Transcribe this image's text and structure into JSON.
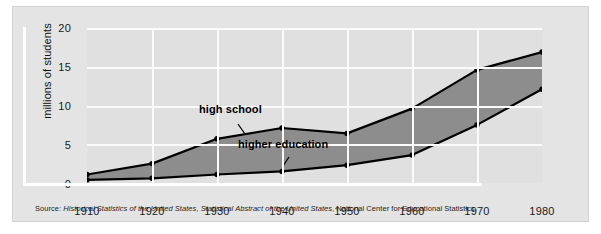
{
  "chart_data": {
    "type": "area",
    "title": "",
    "xlabel": "",
    "ylabel": "millions of students",
    "categories": [
      1910,
      1920,
      1930,
      1940,
      1950,
      1960,
      1970,
      1980
    ],
    "xtick_labels": [
      "1910",
      "1920",
      "1930",
      "1940",
      "1950",
      "1960",
      "1970",
      "1980"
    ],
    "ytick_labels": [
      "0",
      "5",
      "10",
      "15",
      "20"
    ],
    "yticks": [
      0,
      5,
      10,
      15,
      20
    ],
    "ylim": [
      0,
      20
    ],
    "xlim": [
      1910,
      1980
    ],
    "grid": true,
    "legend_position": "inline-annotations",
    "series": [
      {
        "name": "high school",
        "label": "high school",
        "values": [
          1.1,
          2.5,
          5.7,
          7.1,
          6.4,
          9.6,
          14.6,
          16.9
        ],
        "line_color": "#000000",
        "marker": "circle"
      },
      {
        "name": "higher education",
        "label": "higher education",
        "values": [
          0.4,
          0.6,
          1.1,
          1.5,
          2.3,
          3.6,
          7.5,
          12.1
        ],
        "line_color": "#000000",
        "marker": "circle"
      }
    ],
    "band_fill_color": "#8d8d8d",
    "plot_background": "#e0e0e0",
    "gridline_color": "#fbfbfb",
    "annotations": [
      {
        "text": "high school",
        "x": 1933,
        "y": 9.0
      },
      {
        "text": "higher education",
        "x": 1940,
        "y": 4.2
      }
    ]
  },
  "figure": {
    "panel_color": "#e4e4e4",
    "source_prefix": "Source: ",
    "source_italic_1": "Historical Statistics of the United States",
    "source_mid": ", ",
    "source_italic_2": "Statistical Abstract of the United States",
    "source_suffix": ", National Center for Educational Statistics",
    "source_full": "Source: Historical Statistics of the United States, Statistical Abstract of the United States, National Center for Educational Statistics"
  }
}
